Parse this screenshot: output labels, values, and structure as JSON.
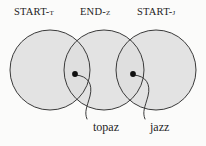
{
  "diagram": {
    "kind": "venn-three-circle",
    "background_color": "#fbfbfa",
    "circle_fill_color": "#dedede",
    "circle_stroke_color": "#3a3a3a",
    "point_color": "#111111",
    "leader_line_color": "#3a3a3a",
    "sets": [
      {
        "label": "START-t",
        "cx": 50,
        "cy": 70,
        "r": 40
      },
      {
        "label": "END-z",
        "cx": 104,
        "cy": 70,
        "r": 40
      },
      {
        "label": "START-j",
        "cx": 156,
        "cy": 70,
        "r": 40
      }
    ],
    "points": [
      {
        "label": "topaz",
        "x": 75,
        "y": 74
      },
      {
        "label": "jazz",
        "x": 133,
        "y": 74
      }
    ]
  }
}
